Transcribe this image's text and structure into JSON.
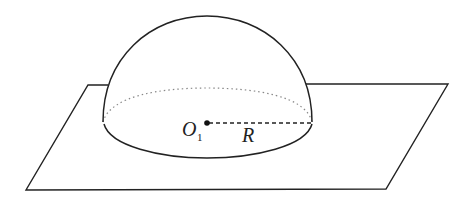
{
  "figure": {
    "labels": {
      "center": "O",
      "center_subscript": "1",
      "radius": "R"
    },
    "colors": {
      "stroke": "#222222",
      "dotted": "#888888",
      "background": "#ffffff"
    }
  }
}
